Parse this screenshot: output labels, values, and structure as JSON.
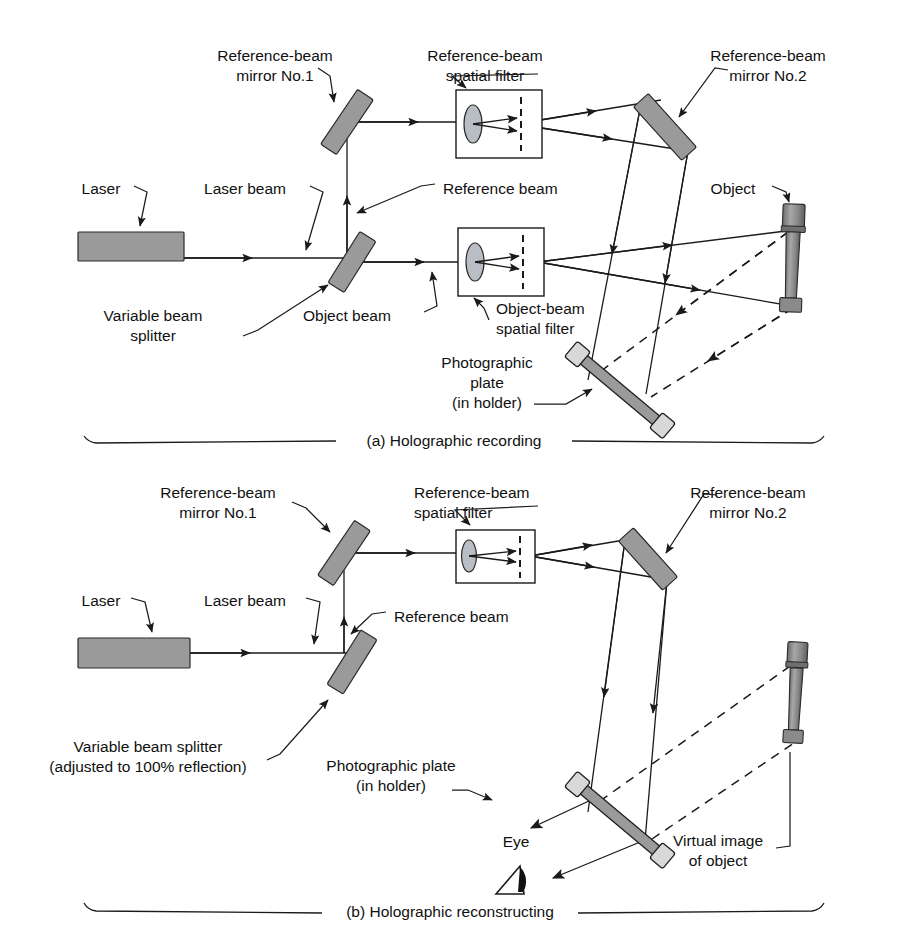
{
  "figure": {
    "panels": [
      {
        "id": "a",
        "caption": "(a) Holographic recording",
        "labels": {
          "reference_mirror_1": "Reference-beam\nmirror No.1",
          "reference_mirror_1_line1": "Reference-beam",
          "reference_mirror_1_line2": "mirror No.1",
          "reference_filter_line1": "Reference-beam",
          "reference_filter_line2": "spatial filter",
          "reference_mirror_2_line1": "Reference-beam",
          "reference_mirror_2_line2": "mirror No.2",
          "laser": "Laser",
          "laser_beam": "Laser beam",
          "reference_beam": "Reference beam",
          "object": "Object",
          "variable_beam_splitter_line1": "Variable beam",
          "variable_beam_splitter_line2": "splitter",
          "object_beam": "Object beam",
          "object_filter_line1": "Object-beam",
          "object_filter_line2": "spatial filter",
          "photographic_plate_line1": "Photographic",
          "photographic_plate_line2": "plate",
          "photographic_plate_line3": "(in holder)"
        }
      },
      {
        "id": "b",
        "caption": "(b) Holographic reconstructing",
        "labels": {
          "reference_mirror_1_line1": "Reference-beam",
          "reference_mirror_1_line2": "mirror No.1",
          "reference_filter_line1": "Reference-beam",
          "reference_filter_line2": "spatial filter",
          "reference_mirror_2_line1": "Reference-beam",
          "reference_mirror_2_line2": "mirror No.2",
          "laser": "Laser",
          "laser_beam": "Laser beam",
          "reference_beam": "Reference beam",
          "variable_beam_splitter_line1": "Variable beam splitter",
          "variable_beam_splitter_line2": "(adjusted to 100% reflection)",
          "photographic_plate_line1": "Photographic plate",
          "photographic_plate_line2": "(in holder)",
          "eye": "Eye",
          "virtual_image_line1": "Virtual image",
          "virtual_image_line2": "of object"
        }
      }
    ],
    "colors": {
      "ink": "#1a1a1a",
      "component_gray": "#9a9a9a",
      "lens_gray": "#b9bec4",
      "background": "#ffffff"
    },
    "components": [
      "laser",
      "variable-beam-splitter",
      "reference-beam-mirror-1",
      "reference-beam-mirror-2",
      "reference-beam-spatial-filter",
      "object-beam-spatial-filter",
      "object",
      "photographic-plate",
      "eye",
      "virtual-image"
    ]
  }
}
